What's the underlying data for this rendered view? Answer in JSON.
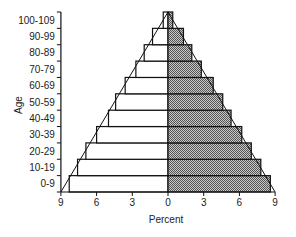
{
  "chart_data": {
    "type": "bar",
    "subtype": "population-pyramid",
    "title": "",
    "xlabel": "Percent",
    "ylabel": "Age",
    "categories": [
      "0-9",
      "10-19",
      "20-29",
      "30-39",
      "40-49",
      "50-59",
      "60-69",
      "70-79",
      "80-89",
      "90-99",
      "100-109"
    ],
    "series": [
      {
        "name": "left",
        "side": "left",
        "fill": "#ffffff",
        "values": [
          8.3,
          7.6,
          6.9,
          6.0,
          5.0,
          4.4,
          3.6,
          2.7,
          2.0,
          1.3,
          0.4
        ]
      },
      {
        "name": "right",
        "side": "right",
        "fill": "#9a9a9a",
        "values": [
          8.6,
          7.8,
          7.0,
          6.2,
          5.3,
          4.6,
          3.8,
          2.8,
          2.0,
          1.3,
          0.4
        ]
      }
    ],
    "reference_triangle": {
      "apex_percent": 0,
      "base_left_percent": 9,
      "base_right_percent": 9
    },
    "x_ticks_left": [
      "9",
      "6",
      "3",
      "0"
    ],
    "x_ticks_right": [
      "3",
      "6",
      "9"
    ],
    "xlim": [
      -9,
      9
    ],
    "grid": false,
    "legend": null
  }
}
